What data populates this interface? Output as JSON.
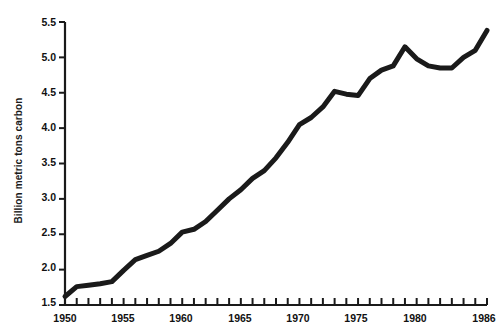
{
  "chart_data": {
    "type": "line",
    "title": "",
    "subtitle": "",
    "xlabel": "",
    "ylabel": "Billion metric tons carbon",
    "xlim": [
      1950,
      1986
    ],
    "ylim": [
      1.5,
      5.5
    ],
    "grid": false,
    "legend": null,
    "legend_position": "none",
    "line_color": "#1a1a1a",
    "line_width_px": 5,
    "x_tick_interval": 1,
    "x_label_interval": 5,
    "y_tick_interval": 0.5,
    "x_tick_labels": [
      "1950",
      "1955",
      "1960",
      "1965",
      "1970",
      "1975",
      "1980",
      "1986"
    ],
    "x_tick_label_values": [
      1950,
      1955,
      1960,
      1965,
      1970,
      1975,
      1980,
      1986
    ],
    "y_tick_labels": [
      "1.5",
      "2.0",
      "2.5",
      "3.0",
      "3.5",
      "4.0",
      "4.5",
      "5.0",
      "5.5"
    ],
    "y_tick_label_values": [
      1.5,
      2.0,
      2.5,
      3.0,
      3.5,
      4.0,
      4.5,
      5.0,
      5.5
    ],
    "x": [
      1950,
      1951,
      1952,
      1953,
      1954,
      1955,
      1956,
      1957,
      1958,
      1959,
      1960,
      1961,
      1962,
      1963,
      1964,
      1965,
      1966,
      1967,
      1968,
      1969,
      1970,
      1971,
      1972,
      1973,
      1974,
      1975,
      1976,
      1977,
      1978,
      1979,
      1980,
      1981,
      1982,
      1983,
      1984,
      1985,
      1986
    ],
    "values": [
      1.62,
      1.76,
      1.78,
      1.8,
      1.83,
      1.99,
      2.14,
      2.2,
      2.26,
      2.37,
      2.53,
      2.57,
      2.68,
      2.84,
      3.0,
      3.13,
      3.29,
      3.4,
      3.58,
      3.8,
      4.05,
      4.15,
      4.3,
      4.52,
      4.48,
      4.46,
      4.7,
      4.82,
      4.88,
      5.15,
      4.98,
      4.88,
      4.85,
      4.85,
      5.0,
      5.1,
      5.38
    ]
  },
  "axis": {
    "y_axis_name": "vertical-axis",
    "x_axis_name": "horizontal-axis"
  }
}
